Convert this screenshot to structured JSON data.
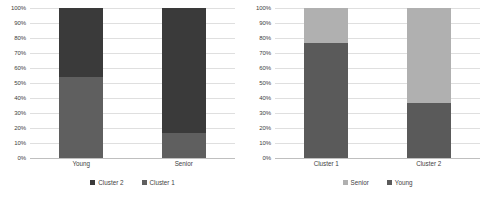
{
  "colors": {
    "dark": "#3a3a3a",
    "mid": "#5f5f5f",
    "light": "#b0b0b0",
    "grid": "#dfdfdf",
    "axis": "#bfbfbf",
    "text": "#3f3f3f",
    "background": "#ffffff"
  },
  "charts": [
    {
      "id": "left-chart",
      "ylabels": [
        "100%",
        "90%",
        "80%",
        "70%",
        "60%",
        "50%",
        "40%",
        "30%",
        "20%",
        "10%",
        "0%"
      ],
      "legend": [
        {
          "label": "Cluster 2",
          "color": "#3a3a3a"
        },
        {
          "label": "Cluster 1",
          "color": "#5f5f5f"
        }
      ],
      "categories": [
        "Young",
        "Senior"
      ],
      "bars": [
        {
          "category": "Young",
          "segments": [
            {
              "name": "Cluster 2",
              "value": 46,
              "color": "#3a3a3a"
            },
            {
              "name": "Cluster 1",
              "value": 54,
              "color": "#5f5f5f"
            }
          ]
        },
        {
          "category": "Senior",
          "segments": [
            {
              "name": "Cluster 2",
              "value": 83,
              "color": "#3a3a3a"
            },
            {
              "name": "Cluster 1",
              "value": 17,
              "color": "#5f5f5f"
            }
          ]
        }
      ]
    },
    {
      "id": "right-chart",
      "ylabels": [
        "100%",
        "90%",
        "80%",
        "70%",
        "60%",
        "50%",
        "40%",
        "30%",
        "20%",
        "10%",
        "0%"
      ],
      "legend": [
        {
          "label": "Senior",
          "color": "#b0b0b0"
        },
        {
          "label": "Young",
          "color": "#5a5a5a"
        }
      ],
      "categories": [
        "Cluster 1",
        "Cluster 2"
      ],
      "bars": [
        {
          "category": "Cluster 1",
          "segments": [
            {
              "name": "Senior",
              "value": 23,
              "color": "#b0b0b0"
            },
            {
              "name": "Young",
              "value": 77,
              "color": "#5a5a5a"
            }
          ]
        },
        {
          "category": "Cluster 2",
          "segments": [
            {
              "name": "Senior",
              "value": 63,
              "color": "#b0b0b0"
            },
            {
              "name": "Young",
              "value": 37,
              "color": "#5a5a5a"
            }
          ]
        }
      ]
    }
  ],
  "chart_data": [
    {
      "type": "bar",
      "subtype": "stacked-100-percent",
      "title": "",
      "xlabel": "",
      "ylabel": "",
      "ylim": [
        0,
        100
      ],
      "yticks": [
        0,
        10,
        20,
        30,
        40,
        50,
        60,
        70,
        80,
        90,
        100
      ],
      "ytick_labels": [
        "0%",
        "10%",
        "20%",
        "30%",
        "40%",
        "50%",
        "60%",
        "70%",
        "80%",
        "90%",
        "100%"
      ],
      "grid": true,
      "legend_position": "bottom",
      "categories": [
        "Young",
        "Senior"
      ],
      "series": [
        {
          "name": "Cluster 1",
          "values": [
            54,
            17
          ],
          "color": "#5f5f5f"
        },
        {
          "name": "Cluster 2",
          "values": [
            46,
            83
          ],
          "color": "#3a3a3a"
        }
      ],
      "stack_order_bottom_to_top": [
        "Cluster 1",
        "Cluster 2"
      ],
      "legend_order": [
        "Cluster 2",
        "Cluster 1"
      ]
    },
    {
      "type": "bar",
      "subtype": "stacked-100-percent",
      "title": "",
      "xlabel": "",
      "ylabel": "",
      "ylim": [
        0,
        100
      ],
      "yticks": [
        0,
        10,
        20,
        30,
        40,
        50,
        60,
        70,
        80,
        90,
        100
      ],
      "ytick_labels": [
        "0%",
        "10%",
        "20%",
        "30%",
        "40%",
        "50%",
        "60%",
        "70%",
        "80%",
        "90%",
        "100%"
      ],
      "grid": true,
      "legend_position": "bottom",
      "categories": [
        "Cluster 1",
        "Cluster 2"
      ],
      "series": [
        {
          "name": "Young",
          "values": [
            77,
            37
          ],
          "color": "#5a5a5a"
        },
        {
          "name": "Senior",
          "values": [
            23,
            63
          ],
          "color": "#b0b0b0"
        }
      ],
      "stack_order_bottom_to_top": [
        "Young",
        "Senior"
      ],
      "legend_order": [
        "Senior",
        "Young"
      ]
    }
  ]
}
